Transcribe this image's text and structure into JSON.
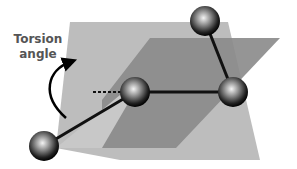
{
  "diagram": {
    "label_line1": "Torsion",
    "label_line2": "angle",
    "colors": {
      "light_plane": "#bdbdbd",
      "dark_plane": "#8a8a8a",
      "bond": "#111111",
      "label": "#555555"
    },
    "atoms": [
      {
        "name": "atom-top",
        "x": 205,
        "y": 21
      },
      {
        "name": "atom-right",
        "x": 233,
        "y": 92
      },
      {
        "name": "atom-center",
        "x": 135,
        "y": 92
      },
      {
        "name": "atom-bottom-left",
        "x": 44,
        "y": 146
      }
    ]
  }
}
